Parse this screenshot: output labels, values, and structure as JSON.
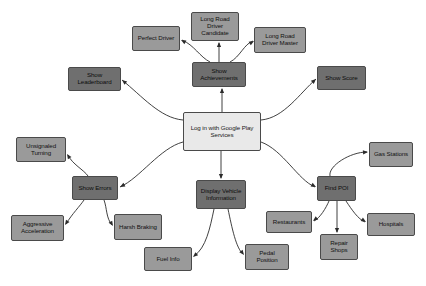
{
  "diagram": {
    "type": "node-link-diagram",
    "canvas": {
      "width": 426,
      "height": 286,
      "background": "#ffffff"
    },
    "palette": {
      "light_node": "#e9e9e9",
      "mid_node": "#9a9a9a",
      "dark_node": "#6f6f6f",
      "border": "#4a4a4a",
      "edge": "#2b2b2b"
    },
    "nodes": [
      {
        "id": "login",
        "label": "Log in with Google Play Services",
        "tone": "light",
        "x": 183,
        "y": 112,
        "w": 78,
        "h": 39,
        "font": 6.2
      },
      {
        "id": "achievements",
        "label": "Show Achievements",
        "tone": "dark",
        "x": 192,
        "y": 62,
        "w": 54,
        "h": 25,
        "font": 6.2
      },
      {
        "id": "leaderboard",
        "label": "Show Leaderboard",
        "tone": "dark",
        "x": 68,
        "y": 67,
        "w": 53,
        "h": 24,
        "font": 6.2
      },
      {
        "id": "score",
        "label": "Show Score",
        "tone": "dark",
        "x": 317,
        "y": 66,
        "w": 49,
        "h": 24,
        "font": 6.2
      },
      {
        "id": "candidate",
        "label": "Long Road Driver Candidate",
        "tone": "mid",
        "x": 191,
        "y": 12,
        "w": 48,
        "h": 29,
        "font": 6.2
      },
      {
        "id": "perfect",
        "label": "Perfect Driver",
        "tone": "mid",
        "x": 132,
        "y": 26,
        "w": 48,
        "h": 25,
        "font": 6.2
      },
      {
        "id": "master",
        "label": "Long Road Driver Master",
        "tone": "mid",
        "x": 254,
        "y": 27,
        "w": 52,
        "h": 26,
        "font": 6.2
      },
      {
        "id": "errors",
        "label": "Show Errors",
        "tone": "dark",
        "x": 72,
        "y": 176,
        "w": 46,
        "h": 24,
        "font": 6.2
      },
      {
        "id": "unsignaled",
        "label": "Unsignaled Turning",
        "tone": "mid",
        "x": 16,
        "y": 137,
        "w": 50,
        "h": 25,
        "font": 6.2
      },
      {
        "id": "aggressive",
        "label": "Aggressive Acceleration",
        "tone": "mid",
        "x": 11,
        "y": 215,
        "w": 53,
        "h": 26,
        "font": 6.2
      },
      {
        "id": "harsh",
        "label": "Harsh Braking",
        "tone": "mid",
        "x": 114,
        "y": 214,
        "w": 48,
        "h": 26,
        "font": 6.2
      },
      {
        "id": "vehicle",
        "label": "Display Vehicle Information",
        "tone": "dark",
        "x": 196,
        "y": 180,
        "w": 50,
        "h": 29,
        "font": 6.2
      },
      {
        "id": "fuel",
        "label": "Fuel Info",
        "tone": "mid",
        "x": 144,
        "y": 247,
        "w": 48,
        "h": 24,
        "font": 6.2
      },
      {
        "id": "pedal",
        "label": "Pedal Position",
        "tone": "mid",
        "x": 245,
        "y": 244,
        "w": 44,
        "h": 26,
        "font": 6.2
      },
      {
        "id": "poi",
        "label": "Find POI",
        "tone": "dark",
        "x": 317,
        "y": 176,
        "w": 39,
        "h": 25,
        "font": 6.2
      },
      {
        "id": "gas",
        "label": "Gas Stations",
        "tone": "mid",
        "x": 369,
        "y": 142,
        "w": 44,
        "h": 25,
        "font": 6.2
      },
      {
        "id": "restaurants",
        "label": "Restaurants",
        "tone": "mid",
        "x": 266,
        "y": 211,
        "w": 46,
        "h": 22,
        "font": 6.2
      },
      {
        "id": "repair",
        "label": "Repair Shops",
        "tone": "mid",
        "x": 320,
        "y": 234,
        "w": 38,
        "h": 26,
        "font": 6.2
      },
      {
        "id": "hospitals",
        "label": "Hospitals",
        "tone": "mid",
        "x": 367,
        "y": 213,
        "w": 48,
        "h": 23,
        "font": 6.2
      }
    ],
    "edges": [
      {
        "from": "login",
        "to": "achievements",
        "path": "M222,112 L222,89",
        "arrow_at": [
          222,
          88
        ]
      },
      {
        "from": "login",
        "to": "leaderboard",
        "path": "M183,120 C160,118 142,96 122,80",
        "arrow_at": [
          122,
          80
        ]
      },
      {
        "from": "login",
        "to": "score",
        "path": "M261,120 C284,118 300,93 316,79",
        "arrow_at": [
          316,
          79
        ]
      },
      {
        "from": "login",
        "to": "errors",
        "path": "M183,142 C160,148 140,178 120,187",
        "arrow_at": [
          120,
          187
        ]
      },
      {
        "from": "login",
        "to": "vehicle",
        "path": "M221,151 L221,178",
        "arrow_at": [
          221,
          179
        ]
      },
      {
        "from": "login",
        "to": "poi",
        "path": "M261,142 C283,150 298,180 315,187",
        "arrow_at": [
          316,
          187
        ]
      },
      {
        "from": "achievements",
        "to": "candidate",
        "path": "M219,62 L219,43",
        "arrow_at": [
          219,
          42
        ]
      },
      {
        "from": "achievements",
        "to": "perfect",
        "path": "M210,62 C200,57 194,45 182,40",
        "arrow_at": [
          181,
          40
        ]
      },
      {
        "from": "achievements",
        "to": "master",
        "path": "M230,62 C240,57 244,44 253,41",
        "arrow_at": [
          254,
          41
        ]
      },
      {
        "from": "errors",
        "to": "unsignaled",
        "path": "M88,176 C84,170 72,164 68,155",
        "arrow_at": [
          67,
          154
        ]
      },
      {
        "from": "errors",
        "to": "aggressive",
        "path": "M84,200 C80,206 72,214 66,224",
        "arrow_at": [
          65,
          225
        ]
      },
      {
        "from": "errors",
        "to": "harsh",
        "path": "M104,200 C107,208 106,218 112,225",
        "arrow_at": [
          113,
          226
        ]
      },
      {
        "from": "vehicle",
        "to": "fuel",
        "path": "M214,209 C210,228 206,248 194,256",
        "arrow_at": [
          193,
          257
        ]
      },
      {
        "from": "vehicle",
        "to": "pedal",
        "path": "M228,209 C232,228 236,248 243,254",
        "arrow_at": [
          244,
          255
        ]
      },
      {
        "from": "poi",
        "to": "gas",
        "path": "M330,176 C328,166 350,152 367,152",
        "arrow_at": [
          368,
          152
        ]
      },
      {
        "from": "poi",
        "to": "restaurants",
        "path": "M329,201 C326,208 320,218 314,221",
        "arrow_at": [
          313,
          221
        ]
      },
      {
        "from": "poi",
        "to": "repair",
        "path": "M337,201 L337,232",
        "arrow_at": [
          337,
          233
        ]
      },
      {
        "from": "poi",
        "to": "hospitals",
        "path": "M346,201 C352,210 358,219 365,222",
        "arrow_at": [
          366,
          222
        ]
      }
    ]
  }
}
